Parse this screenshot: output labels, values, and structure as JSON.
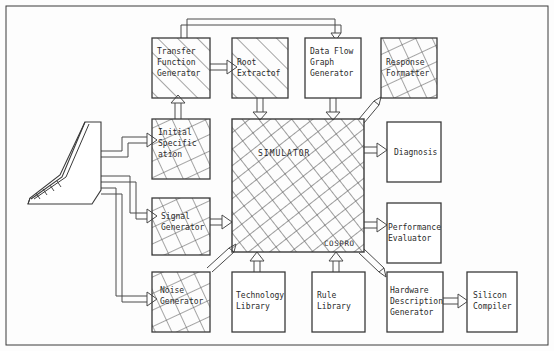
{
  "diagram": {
    "border_color": "#3a3a3a",
    "box_stroke": "#3a3a3a",
    "hatch_color": "#555555",
    "arrow_color": "#4a4a4a",
    "background": "#fdfdfd"
  },
  "terminal": {
    "name": "workstation-terminal",
    "label": ""
  },
  "blocks": [
    {
      "id": "transfer_function_generator",
      "label": "Transfer\nFunction\nGenerator",
      "x": 152,
      "y": 38,
      "w": 58,
      "h": 60,
      "fill": "diagonal"
    },
    {
      "id": "root_extractor",
      "label": "Root\nExtractof",
      "x": 232,
      "y": 38,
      "w": 56,
      "h": 60,
      "fill": "diagonal"
    },
    {
      "id": "data_flow_graph_generator",
      "label": "Data Flow\nGraph\nGenerator",
      "x": 305,
      "y": 38,
      "w": 56,
      "h": 60,
      "fill": "none"
    },
    {
      "id": "response_formatter",
      "label": "Response\nFormatter",
      "x": 381,
      "y": 38,
      "w": 56,
      "h": 60,
      "fill": "cross"
    },
    {
      "id": "initial_specification",
      "label": "Initial\nSpecific\nation",
      "x": 152,
      "y": 119,
      "w": 58,
      "h": 60,
      "fill": "cross"
    },
    {
      "id": "simulator",
      "label": "SIMULATOR",
      "x": 232,
      "y": 119,
      "w": 132,
      "h": 133,
      "fill": "cross-dense"
    },
    {
      "id": "diagnosis",
      "label": "Diagnosis",
      "x": 387,
      "y": 122,
      "w": 54,
      "h": 60,
      "fill": "none"
    },
    {
      "id": "signal_generator",
      "label": "Signal\nGenerator",
      "x": 152,
      "y": 198,
      "w": 58,
      "h": 57,
      "fill": "cross"
    },
    {
      "id": "performance_evaluator",
      "label": "Performance\nEvaluator",
      "x": 387,
      "y": 203,
      "w": 54,
      "h": 60,
      "fill": "none"
    },
    {
      "id": "noise_generator",
      "label": "Noise\nGenerator",
      "x": 152,
      "y": 272,
      "w": 58,
      "h": 60,
      "fill": "cross"
    },
    {
      "id": "technology_library",
      "label": "Technology\nLibrary",
      "x": 232,
      "y": 272,
      "w": 53,
      "h": 60,
      "fill": "none"
    },
    {
      "id": "rule_library",
      "label": "Rule\nLibrary",
      "x": 312,
      "y": 272,
      "w": 53,
      "h": 60,
      "fill": "none"
    },
    {
      "id": "hardware_description_generator",
      "label": "Hardware\nDescription\nGenerator",
      "x": 387,
      "y": 272,
      "w": 56,
      "h": 60,
      "fill": "none"
    },
    {
      "id": "silicon_compiler",
      "label": "Silicon\nCompiler",
      "x": 467,
      "y": 272,
      "w": 50,
      "h": 60,
      "fill": "none"
    }
  ],
  "sub_labels": [
    {
      "id": "cospro",
      "label": "COSPRO",
      "x": 324,
      "y": 240
    }
  ],
  "connections": [
    {
      "from": "transfer_function_generator",
      "to": "root_extractor",
      "style": "hollow-arrow-right"
    },
    {
      "from": "transfer_function_generator",
      "to": "data_flow_graph_generator",
      "style": "feedback-top-loop"
    },
    {
      "from": "initial_specification",
      "to": "transfer_function_generator",
      "style": "hollow-arrow-up"
    },
    {
      "from": "root_extractor",
      "to": "simulator",
      "style": "hollow-arrow-down"
    },
    {
      "from": "data_flow_graph_generator",
      "to": "simulator",
      "style": "hollow-arrow-down"
    },
    {
      "from": "simulator",
      "to": "response_formatter",
      "style": "hollow-arrow-diagonal-up"
    },
    {
      "from": "simulator",
      "to": "diagnosis",
      "style": "hollow-arrow-right"
    },
    {
      "from": "simulator",
      "to": "performance_evaluator",
      "style": "hollow-arrow-right"
    },
    {
      "from": "simulator",
      "to": "hardware_description_generator",
      "style": "hollow-arrow-diagonal-down"
    },
    {
      "from": "signal_generator",
      "to": "simulator",
      "style": "hollow-arrow-right"
    },
    {
      "from": "noise_generator",
      "to": "simulator",
      "style": "hollow-arrow-diagonal-up"
    },
    {
      "from": "technology_library",
      "to": "simulator",
      "style": "hollow-arrow-up"
    },
    {
      "from": "rule_library",
      "to": "simulator",
      "style": "hollow-arrow-up"
    },
    {
      "from": "hardware_description_generator",
      "to": "silicon_compiler",
      "style": "hollow-arrow-right"
    },
    {
      "from": "workstation-terminal",
      "to": "initial_specification",
      "style": "hollow-arrow-right"
    },
    {
      "from": "workstation-terminal",
      "to": "signal_generator",
      "style": "hollow-arrow-right"
    },
    {
      "from": "workstation-terminal",
      "to": "noise_generator",
      "style": "hollow-arrow-right"
    }
  ]
}
